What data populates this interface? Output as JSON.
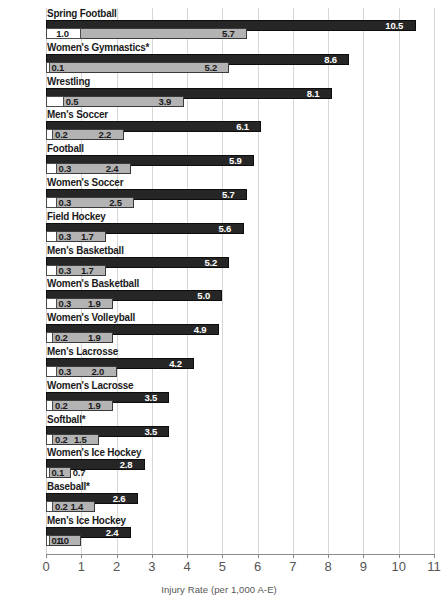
{
  "chart_data": {
    "type": "bar",
    "orientation": "horizontal",
    "title": "",
    "xlabel": "Injury Rate (per 1,000 A-E)",
    "ylabel": "",
    "xlim": [
      0,
      11
    ],
    "xticks": [
      "0",
      "1",
      "2",
      "3",
      "4",
      "5",
      "6",
      "7",
      "8",
      "9",
      "10",
      "11"
    ],
    "grid": true,
    "legend": "none",
    "categories": [
      "Spring Football",
      "Women's Gymnastics*",
      "Wrestling",
      "Men's Soccer",
      "Football",
      "Women's Soccer",
      "Field Hockey",
      "Men's Basketball",
      "Women's Basketball",
      "Women's Volleyball",
      "Men's Lacrosse",
      "Women's Lacrosse",
      "Softball*",
      "Women's Ice Hockey",
      "Baseball*",
      "Men's Ice Hockey"
    ],
    "series": [
      {
        "name": "white",
        "color": "#ffffff",
        "values": [
          1.0,
          0.1,
          0.5,
          0.2,
          0.3,
          0.3,
          0.3,
          0.3,
          0.3,
          0.2,
          0.3,
          0.2,
          0.2,
          0.1,
          0.2,
          0.1
        ],
        "labels": [
          "1.0",
          "0.1",
          "0.5",
          "0.2",
          "0.3",
          "0.3",
          "0.3",
          "0.3",
          "0.3",
          "0.2",
          "0.3",
          "0.2",
          "0.2",
          "0.1",
          "0.2",
          "0.1"
        ]
      },
      {
        "name": "gray",
        "color": "#b3b3b3",
        "values": [
          5.7,
          5.2,
          3.9,
          2.2,
          2.4,
          2.5,
          1.7,
          1.7,
          1.9,
          1.9,
          2.0,
          1.9,
          1.5,
          0.7,
          1.4,
          1.0
        ],
        "labels": [
          "5.7",
          "5.2",
          "3.9",
          "2.2",
          "2.4",
          "2.5",
          "1.7",
          "1.7",
          "1.9",
          "1.9",
          "2.0",
          "1.9",
          "1.5",
          "0.7",
          "1.4",
          "1.0"
        ]
      },
      {
        "name": "black",
        "color": "#262626",
        "values": [
          10.5,
          8.6,
          8.1,
          6.1,
          5.9,
          5.7,
          5.6,
          5.2,
          5.0,
          4.9,
          4.2,
          3.5,
          3.5,
          2.8,
          2.6,
          2.4
        ],
        "labels": [
          "10.5",
          "8.6",
          "8.1",
          "6.1",
          "5.9",
          "5.7",
          "5.6",
          "5.2",
          "5.0",
          "4.9",
          "4.2",
          "3.5",
          "3.5",
          "2.8",
          "2.6",
          "2.4"
        ]
      }
    ]
  }
}
